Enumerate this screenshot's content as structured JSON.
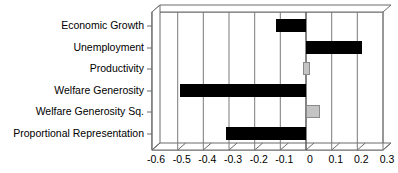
{
  "chart_data": {
    "type": "bar",
    "orientation": "horizontal",
    "title": "",
    "subtitle": "",
    "xlabel": "",
    "ylabel": "",
    "xlim": [
      -0.6,
      0.3
    ],
    "xticks": [
      "-0.6",
      "-0.5",
      "-0.4",
      "-0.3",
      "-0.2",
      "-0.1",
      "0",
      "0.1",
      "0.2",
      "0.3"
    ],
    "xtick_values": [
      -0.6,
      -0.5,
      -0.4,
      -0.3,
      -0.2,
      -0.1,
      0,
      0.1,
      0.2,
      0.3
    ],
    "grid": "vertical",
    "legend": "none",
    "categories": [
      "Economic Growth",
      "Unemployment",
      "Productivity",
      "Welfare Generosity",
      "Welfare Generosity Sq.",
      "Proportional Representation"
    ],
    "values": [
      -0.115,
      0.22,
      0.012,
      -0.49,
      0.055,
      -0.31
    ],
    "bar_colors": [
      "#000000",
      "#000000",
      "#c4c4c4",
      "#000000",
      "#c4c4c4",
      "#000000"
    ],
    "style": "3d-horizontal-bar"
  },
  "axis": {
    "tick_labels": [
      "-0.6",
      "-0.5",
      "-0.4",
      "-0.3",
      "-0.2",
      "-0.1",
      "0",
      "0.1",
      "0.2",
      "0.3"
    ]
  },
  "categories": [
    {
      "label": "Economic Growth"
    },
    {
      "label": "Unemployment"
    },
    {
      "label": "Productivity"
    },
    {
      "label": "Welfare Generosity"
    },
    {
      "label": "Welfare Generosity Sq."
    },
    {
      "label": "Proportional Representation"
    }
  ]
}
